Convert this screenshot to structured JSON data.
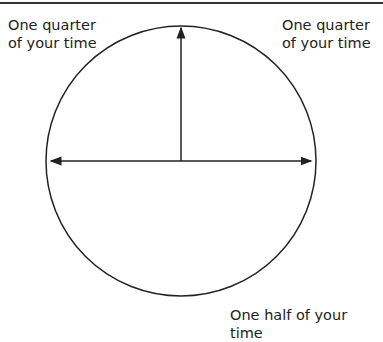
{
  "diagram": {
    "labels": {
      "top_left": [
        "One quarter",
        "of your time"
      ],
      "top_right": [
        "One quarter",
        "of your time"
      ],
      "bottom_right": "One half of your time"
    },
    "colors": {
      "stroke": "#222222",
      "background": "#ffffff"
    }
  }
}
